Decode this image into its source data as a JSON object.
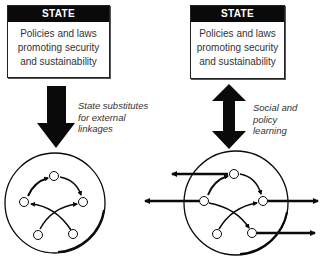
{
  "left_panel": {
    "box": {
      "header": "STATE",
      "lines": [
        "Policies and laws",
        "promoting security",
        "and sustainability"
      ]
    },
    "arrow_type": "single-down",
    "caption": [
      "State substitutes",
      "for external",
      "linkages"
    ],
    "network": {
      "nodes": 5,
      "external_arrows": 0
    }
  },
  "right_panel": {
    "box": {
      "header": "STATE",
      "lines": [
        "Policies and laws",
        "promoting security",
        "and sustainability"
      ]
    },
    "arrow_type": "double-vertical",
    "caption": [
      "Social and",
      "policy",
      "learning"
    ],
    "network": {
      "nodes": 5,
      "external_arrows": 4
    }
  },
  "colors": {
    "ink": "#0a0a0a",
    "text": "#333333",
    "background": "#ffffff"
  }
}
